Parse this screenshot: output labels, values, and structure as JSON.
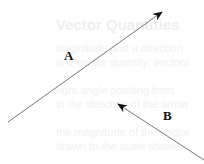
{
  "diagram": {
    "background_text": {
      "title": "Vector Quantities",
      "lines": [
        "magnitude and a direction",
        "is a vector quantity; vectors",
        "right angle pointing from",
        "in the direction of the arrow",
        "the magnitude of the vector",
        "drawn to the scale shown"
      ]
    },
    "vectors": [
      {
        "label": "A",
        "from": [
          8,
          122
        ],
        "to": [
          162,
          12
        ]
      },
      {
        "label": "B",
        "from": [
          204,
          160
        ],
        "to": [
          118,
          104
        ]
      }
    ],
    "colors": {
      "arrow": "#666666",
      "label": "#111111"
    }
  }
}
